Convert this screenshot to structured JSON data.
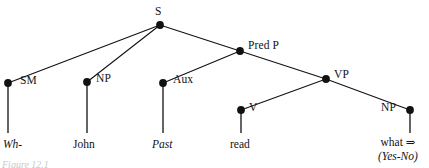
{
  "figure": {
    "caption": "Figure 12.1",
    "background_color": "#ffffff",
    "ink_color": "#121212"
  },
  "tree": {
    "type": "syntax-tree",
    "nodes": [
      {
        "id": "S",
        "label": "S",
        "x": 160,
        "y": 25,
        "label_x": 155,
        "label_y": 5,
        "label_align": "above"
      },
      {
        "id": "PredP",
        "label": "Pred P",
        "x": 240,
        "y": 51,
        "label_x": 248,
        "label_y": 39,
        "label_align": "right"
      },
      {
        "id": "SM",
        "label": "SM",
        "x": 8,
        "y": 83,
        "label_x": 20,
        "label_y": 74,
        "label_align": "right"
      },
      {
        "id": "NP1",
        "label": "NP",
        "x": 87,
        "y": 82,
        "label_x": 96,
        "label_y": 72,
        "label_align": "right"
      },
      {
        "id": "Aux",
        "label": "Aux",
        "x": 163,
        "y": 83,
        "label_x": 173,
        "label_y": 73,
        "label_align": "right"
      },
      {
        "id": "VP",
        "label": "VP",
        "x": 326,
        "y": 79,
        "label_x": 334,
        "label_y": 68,
        "label_align": "right"
      },
      {
        "id": "V",
        "label": "V",
        "x": 241,
        "y": 110,
        "label_x": 249,
        "label_y": 101,
        "label_align": "right"
      },
      {
        "id": "NP2",
        "label": "NP",
        "x": 410,
        "y": 110,
        "label_x": 381,
        "label_y": 101,
        "label_align": "left"
      }
    ],
    "edges": [
      {
        "from": "S",
        "to": "SM"
      },
      {
        "from": "S",
        "to": "NP1"
      },
      {
        "from": "S",
        "to": "PredP"
      },
      {
        "from": "PredP",
        "to": "Aux"
      },
      {
        "from": "PredP",
        "to": "VP"
      },
      {
        "from": "VP",
        "to": "V"
      },
      {
        "from": "VP",
        "to": "NP2"
      }
    ],
    "stems": [
      {
        "node": "SM",
        "x": 8,
        "from_y": 83,
        "to_y": 133
      },
      {
        "node": "NP1",
        "x": 87,
        "from_y": 82,
        "to_y": 133
      },
      {
        "node": "Aux",
        "x": 163,
        "from_y": 83,
        "to_y": 133
      },
      {
        "node": "V",
        "x": 241,
        "from_y": 110,
        "to_y": 133
      },
      {
        "node": "NP2",
        "x": 410,
        "from_y": 110,
        "to_y": 133
      }
    ],
    "leaves": [
      {
        "node": "SM",
        "text": "Wh-",
        "style": "italic",
        "x": 3,
        "y": 138
      },
      {
        "node": "NP1",
        "text": "John",
        "style": "roman",
        "x": 73,
        "y": 138
      },
      {
        "node": "Aux",
        "text": "Past",
        "style": "italic",
        "x": 152,
        "y": 138
      },
      {
        "node": "V",
        "text": "read",
        "style": "roman",
        "x": 230,
        "y": 138
      }
    ],
    "leaf_stack": {
      "node": "NP2",
      "x": 378,
      "y": 136,
      "line1": "what ⇒",
      "line2": "(Yes-No)"
    }
  }
}
